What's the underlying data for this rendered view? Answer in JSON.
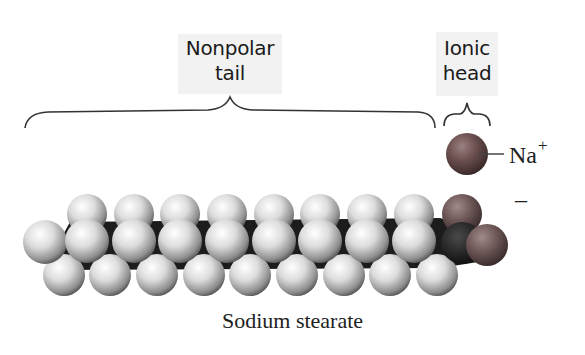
{
  "figure": {
    "caption": "Sodium stearate",
    "labels": {
      "tail": {
        "line1": "Nonpolar",
        "line2": "tail"
      },
      "head": {
        "line1": "Ionic",
        "line2": "head"
      }
    },
    "ion": {
      "symbol": "Na",
      "charge": "+"
    },
    "head_charge": "–",
    "colors": {
      "background": "#ffffff",
      "label_box": "#f2f2f2",
      "hydrogen": "#d9d9d9",
      "carbon": "#1c1c1c",
      "oxygen": "#6e5555",
      "sodium": "#6a4e4e",
      "bracket": "#333333"
    },
    "molecule": {
      "hydrogen_top_x": [
        87,
        134,
        180,
        227,
        274,
        320,
        367,
        414
      ],
      "hydrogen_mid_x": [
        87,
        134,
        180,
        227,
        274,
        320,
        367,
        414
      ],
      "hydrogen_bottom_x": [
        64,
        110,
        157,
        204,
        250,
        297,
        344,
        390,
        437
      ]
    }
  }
}
